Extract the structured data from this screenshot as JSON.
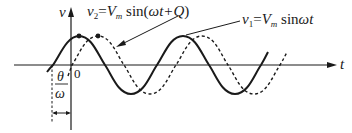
{
  "diagram": {
    "axes": {
      "x_label": "t",
      "y_label": "v",
      "origin_label": "0"
    },
    "curves": [
      {
        "name": "v1",
        "style": "solid",
        "label_var": "v",
        "label_sub": "1",
        "label_eq": "=",
        "label_amp": "V",
        "label_amp_sub": "m",
        "label_fn": "sin",
        "label_arg": "ωt"
      },
      {
        "name": "v2",
        "style": "dashed",
        "label_var": "v",
        "label_sub": "2",
        "label_eq": "=",
        "label_amp": "V",
        "label_amp_sub": "m",
        "label_fn": "sin",
        "label_arg_open": "(",
        "label_arg": "ωt+Q",
        "label_arg_close": ")"
      }
    ],
    "phase_shift": {
      "numerator": "θ",
      "denominator": "ω"
    },
    "colors": {
      "line": "#1a1a1a",
      "background": "#ffffff"
    }
  }
}
